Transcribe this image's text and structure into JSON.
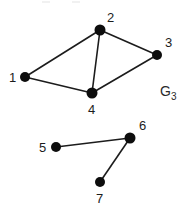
{
  "figure": {
    "label": "G",
    "label_subscript": "3",
    "background_color": "#ffffff",
    "node_color": "#0d0d0d",
    "edge_color": "#1c1c1c",
    "text_color": "#1c1c1c",
    "width": 190,
    "height": 216
  },
  "graph_data": {
    "type": "graph",
    "directed": false,
    "name": "G3",
    "components": 2,
    "node_count": 7,
    "edge_count": 7,
    "nodes": [
      {
        "id": "1",
        "label": "1",
        "x": 25,
        "y": 77,
        "r": 5,
        "label_x": 9,
        "label_y": 82,
        "component": 1
      },
      {
        "id": "2",
        "label": "2",
        "x": 100,
        "y": 30,
        "r": 5.5,
        "label_x": 107,
        "label_y": 22,
        "component": 1
      },
      {
        "id": "3",
        "label": "3",
        "x": 157,
        "y": 55,
        "r": 5,
        "label_x": 165,
        "label_y": 47,
        "component": 1
      },
      {
        "id": "4",
        "label": "4",
        "x": 92,
        "y": 93,
        "r": 5.5,
        "label_x": 88,
        "label_y": 114,
        "component": 1
      },
      {
        "id": "5",
        "label": "5",
        "x": 56,
        "y": 147,
        "r": 5,
        "label_x": 39,
        "label_y": 152,
        "component": 2
      },
      {
        "id": "6",
        "label": "6",
        "x": 130,
        "y": 138,
        "r": 5.5,
        "label_x": 139,
        "label_y": 130,
        "component": 2
      },
      {
        "id": "7",
        "label": "7",
        "x": 100,
        "y": 182,
        "r": 5,
        "label_x": 96,
        "label_y": 203,
        "component": 2
      }
    ],
    "edges": [
      {
        "source": "1",
        "target": "2",
        "x1": 25,
        "y1": 77,
        "x2": 100,
        "y2": 30
      },
      {
        "source": "2",
        "target": "3",
        "x1": 100,
        "y1": 30,
        "x2": 157,
        "y2": 55
      },
      {
        "source": "2",
        "target": "4",
        "x1": 100,
        "y1": 30,
        "x2": 92,
        "y2": 93
      },
      {
        "source": "1",
        "target": "4",
        "x1": 25,
        "y1": 77,
        "x2": 92,
        "y2": 93
      },
      {
        "source": "4",
        "target": "3",
        "x1": 92,
        "y1": 93,
        "x2": 157,
        "y2": 55
      },
      {
        "source": "5",
        "target": "6",
        "x1": 56,
        "y1": 147,
        "x2": 130,
        "y2": 138
      },
      {
        "source": "6",
        "target": "7",
        "x1": 130,
        "y1": 138,
        "x2": 100,
        "y2": 182
      }
    ],
    "annotation": {
      "text": "G",
      "subscript": "3",
      "x": 160,
      "y": 96
    }
  }
}
